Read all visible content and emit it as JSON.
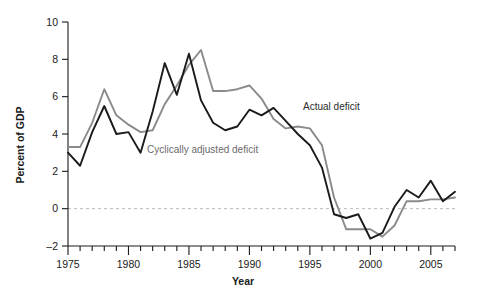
{
  "chart_data": {
    "type": "line",
    "title": "",
    "xlabel": "Year",
    "ylabel": "Percent of GDP",
    "xlim": [
      1975,
      2007
    ],
    "ylim": [
      -2,
      10
    ],
    "yticks": [
      -2,
      0,
      2,
      4,
      6,
      8,
      10
    ],
    "ytick_labels": [
      "–2",
      "0",
      "2",
      "4",
      "6",
      "8",
      "10"
    ],
    "xticks_major": [
      1975,
      1980,
      1985,
      1990,
      1995,
      2000,
      2005
    ],
    "xtick_labels": [
      "1975",
      "1980",
      "1985",
      "1990",
      "1995",
      "2000",
      "2005"
    ],
    "xticks_minor_step": 1,
    "grid": false,
    "zero_reference_line": 0,
    "legend_position": "inline-annotations",
    "x": [
      1975,
      1976,
      1977,
      1978,
      1979,
      1980,
      1981,
      1982,
      1983,
      1984,
      1985,
      1986,
      1987,
      1988,
      1989,
      1990,
      1991,
      1992,
      1993,
      1994,
      1995,
      1996,
      1997,
      1998,
      1999,
      2000,
      2001,
      2002,
      2003,
      2004,
      2005,
      2006,
      2007
    ],
    "series": [
      {
        "name": "Actual deficit",
        "color": "#1a1a1a",
        "values": [
          3.0,
          2.3,
          4.1,
          5.5,
          4.0,
          4.1,
          3.0,
          5.2,
          7.8,
          6.1,
          8.3,
          5.8,
          4.6,
          4.2,
          4.4,
          5.3,
          5.0,
          5.4,
          4.7,
          4.0,
          3.4,
          2.2,
          -0.3,
          -0.5,
          -0.3,
          -1.6,
          -1.3,
          0.1,
          1.0,
          0.6,
          1.5,
          0.4,
          0.9
        ]
      },
      {
        "name": "Cyclically adjusted deficit",
        "color": "#8a8a8a",
        "values": [
          3.3,
          3.3,
          4.6,
          6.4,
          5.0,
          4.5,
          4.1,
          4.2,
          5.6,
          6.6,
          7.7,
          8.5,
          6.3,
          6.3,
          6.4,
          6.6,
          5.9,
          4.8,
          4.3,
          4.4,
          4.3,
          3.4,
          0.6,
          -1.1,
          -1.1,
          -1.1,
          -1.5,
          -0.9,
          0.4,
          0.4,
          0.5,
          0.5,
          0.6
        ]
      }
    ],
    "annotations": [
      {
        "text": "Actual deficit",
        "series": "Actual deficit",
        "color": "#2b2b2b"
      },
      {
        "text": "Cyclically adjusted deficit",
        "series": "Cyclically adjusted deficit",
        "color": "#6b6b6b"
      }
    ]
  }
}
